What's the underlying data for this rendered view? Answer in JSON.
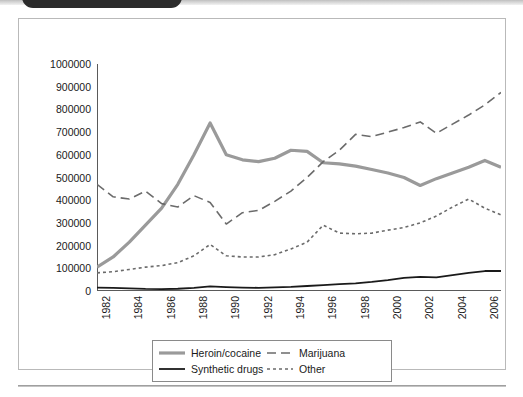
{
  "page": {
    "bottom_rule": "horizontal-rule"
  },
  "figure": {
    "frame": "chart-frame"
  },
  "chart_data": {
    "type": "line",
    "title": "",
    "subtitle": "",
    "xlabel": "",
    "ylabel": "",
    "xlim": [
      1982,
      2007
    ],
    "ylim": [
      0,
      1000000
    ],
    "grid": false,
    "legend_position": "bottom",
    "ytick_labels": [
      "1000000",
      "900000",
      "800000",
      "700000",
      "600000",
      "500000",
      "400000",
      "300000",
      "200000",
      "100000",
      "0"
    ],
    "ytick_values": [
      1000000,
      900000,
      800000,
      700000,
      600000,
      500000,
      400000,
      300000,
      200000,
      100000,
      0
    ],
    "xtick_labels": [
      "1982",
      "1984",
      "1986",
      "1988",
      "1990",
      "1992",
      "1994",
      "1996",
      "1998",
      "2000",
      "2002",
      "2004",
      "2006"
    ],
    "xtick_values": [
      1982,
      1984,
      1986,
      1988,
      1990,
      1992,
      1994,
      1996,
      1998,
      2000,
      2002,
      2004,
      2006
    ],
    "x": [
      1982,
      1983,
      1984,
      1985,
      1986,
      1987,
      1988,
      1989,
      1990,
      1991,
      1992,
      1993,
      1994,
      1995,
      1996,
      1997,
      1998,
      1999,
      2000,
      2001,
      2002,
      2003,
      2004,
      2005,
      2006,
      2007
    ],
    "series": [
      {
        "name": "Heroin/cocaine",
        "color": "#9a9a9a",
        "style": "solid",
        "width": 3.2,
        "values": [
          105000,
          150000,
          215000,
          290000,
          365000,
          470000,
          600000,
          740000,
          600000,
          578000,
          570000,
          585000,
          620000,
          615000,
          565000,
          560000,
          550000,
          535000,
          520000,
          500000,
          465000,
          495000,
          520000,
          545000,
          575000,
          545000
        ]
      },
      {
        "name": "Marijuana",
        "color": "#6b6b6b",
        "style": "dashed",
        "width": 1.6,
        "values": [
          470000,
          415000,
          405000,
          440000,
          385000,
          370000,
          420000,
          390000,
          295000,
          345000,
          355000,
          395000,
          440000,
          500000,
          570000,
          620000,
          690000,
          680000,
          700000,
          720000,
          745000,
          695000,
          735000,
          775000,
          820000,
          875000
        ]
      },
      {
        "name": "Other",
        "color": "#6b6b6b",
        "style": "dotted",
        "width": 1.6,
        "values": [
          80000,
          85000,
          95000,
          105000,
          112000,
          125000,
          155000,
          205000,
          155000,
          150000,
          150000,
          160000,
          185000,
          215000,
          290000,
          255000,
          252000,
          255000,
          268000,
          280000,
          300000,
          330000,
          370000,
          405000,
          365000,
          335000
        ]
      },
      {
        "name": "Synthetic drugs",
        "color": "#1a1a1a",
        "style": "solid",
        "width": 1.8,
        "values": [
          15000,
          14000,
          12000,
          9000,
          8000,
          10000,
          14000,
          20000,
          17000,
          15000,
          14000,
          16000,
          18000,
          22000,
          26000,
          30000,
          34000,
          40000,
          48000,
          58000,
          62000,
          60000,
          70000,
          80000,
          88000,
          88000
        ]
      }
    ]
  },
  "legend": {
    "items": [
      {
        "label": "Heroin/cocaine",
        "style": "solid-thick-gray"
      },
      {
        "label": "Marijuana",
        "style": "long-dash"
      },
      {
        "label": "Synthetic drugs",
        "style": "solid-thin-black"
      },
      {
        "label": "Other",
        "style": "short-dash"
      }
    ]
  }
}
